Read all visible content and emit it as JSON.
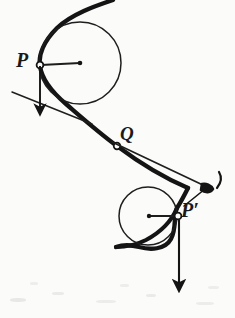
{
  "figure": {
    "background_color": "#fbfbfa",
    "ink_color": "#141414",
    "labels": {
      "point_p": "P",
      "point_q": "Q",
      "point_p_prime": "P′"
    },
    "annotations": {
      "upper_tangent_point": "P",
      "inflection_point": "Q",
      "lower_tangent_point": "P′"
    },
    "elements": {
      "main_curve_name": "cycloid-curve",
      "upper_circle_name": "upper-rolling-circle",
      "lower_circle_name": "lower-rolling-circle",
      "upper_arrow_name": "upper-force-arrow",
      "lower_arrow_name": "lower-force-arrow",
      "velocity_arrow_name": "velocity-arrow",
      "upper_tangent_line_name": "upper-tangent-line",
      "lower_tangent_line_name": "lower-tangent-line"
    },
    "geometry": {
      "upper_circle_center": [
        80,
        63
      ],
      "upper_circle_radius": 41,
      "lower_circle_center": [
        148,
        216
      ],
      "lower_circle_radius": 29,
      "point_p_position": [
        40,
        65
      ],
      "point_q_position": [
        117,
        146
      ],
      "point_p_prime_position": [
        178,
        216
      ]
    }
  }
}
